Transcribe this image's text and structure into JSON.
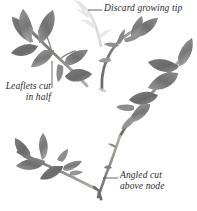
{
  "figure": {
    "background_color": "#ffffff",
    "ink_color": "#2b2b2b",
    "foliage_dark": "#676767",
    "foliage_mid": "#8a8a8a",
    "foliage_light": "#b4b4b4",
    "stem_color": "#7d7a76",
    "ghost_color": "#dcdcdc"
  },
  "annotations": {
    "discard_tip": {
      "text": "Discard growing tip",
      "leader": "horizontal-left"
    },
    "leaflets_cut": {
      "line1": "Leaflets cut",
      "line2": "in half",
      "leader": "vertical-up"
    },
    "angled_cut": {
      "line1": "Angled cut",
      "line2": "above node",
      "leader": "horizontal-left"
    }
  },
  "specimens": [
    {
      "name": "upper-left-cutting",
      "description": "stem with leaflets cut in half"
    },
    {
      "name": "center-cutting",
      "description": "curved stem with growing tip removed"
    },
    {
      "name": "right-cutting",
      "description": "stem with full compound leaves"
    },
    {
      "name": "lower-left-cutting",
      "description": "stem with angled basal cut"
    }
  ]
}
